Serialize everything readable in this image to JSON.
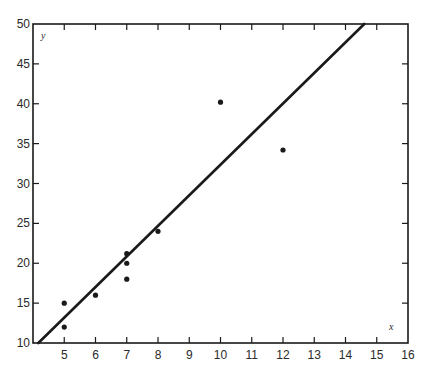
{
  "chart_data": {
    "type": "scatter",
    "title": "",
    "xlabel": "x",
    "ylabel": "y",
    "xlim": [
      4,
      16
    ],
    "ylim": [
      10,
      50
    ],
    "grid": false,
    "legend": null,
    "x_ticks": [
      5,
      6,
      7,
      8,
      9,
      10,
      11,
      12,
      13,
      14,
      15,
      16
    ],
    "y_ticks": [
      10,
      15,
      20,
      25,
      30,
      35,
      40,
      45,
      50
    ],
    "series": [
      {
        "name": "observations",
        "type": "scatter",
        "points": [
          {
            "x": 5,
            "y": 15
          },
          {
            "x": 5,
            "y": 12
          },
          {
            "x": 6,
            "y": 16
          },
          {
            "x": 7,
            "y": 21.2
          },
          {
            "x": 7,
            "y": 20
          },
          {
            "x": 7,
            "y": 18
          },
          {
            "x": 8,
            "y": 24
          },
          {
            "x": 10,
            "y": 40.2
          },
          {
            "x": 12,
            "y": 34.2
          }
        ]
      },
      {
        "name": "fitted line",
        "type": "line",
        "points": [
          {
            "x": 4.17,
            "y": 10
          },
          {
            "x": 14.6,
            "y": 50
          }
        ]
      }
    ]
  },
  "labels": {
    "x_axis_var": "x",
    "y_axis_var": "y"
  },
  "colors": {
    "ink": "#1a1a1a",
    "background": "#ffffff"
  }
}
